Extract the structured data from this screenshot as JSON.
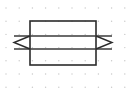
{
  "canvas": {
    "width": 128,
    "height": 88,
    "background_color": "#ffffff",
    "title": "Dimension arrow through rectangle on dot grid"
  },
  "grid": {
    "name": "dot-grid",
    "dot_color": "#c9c9c9",
    "dot_radius": 0.7,
    "origin_x": 6,
    "origin_y": 8,
    "spacing_x": 13.2,
    "spacing_y": 13.2,
    "columns": 10,
    "rows": 7
  },
  "shapes": {
    "rectangle": {
      "name": "outer-rectangle",
      "x": 30,
      "y": 21,
      "width": 66,
      "height": 44,
      "stroke_color": "#2b2b2b",
      "stroke_width": 1.6,
      "fill": "none"
    },
    "band": {
      "name": "horizontal-band",
      "top_line_y": 36,
      "bottom_line_y": 49,
      "left_x": 14,
      "right_x": 112,
      "stroke_color": "#3a3a3a",
      "stroke_width": 1.5
    },
    "left_arrow_head": {
      "name": "left-arrowhead",
      "tip_x": 14,
      "tip_y": 42.5,
      "base_x": 30,
      "top_y": 36,
      "bottom_y": 49,
      "stroke_color": "#2b2b2b"
    },
    "right_arrow_head": {
      "name": "right-arrowhead",
      "tip_x": 112,
      "tip_y": 42.5,
      "base_x": 96,
      "top_y": 36,
      "bottom_y": 49,
      "stroke_color": "#2b2b2b"
    }
  },
  "chart_data": {
    "type": "diagram",
    "elements": [
      {
        "kind": "rectangle",
        "x": 30,
        "y": 21,
        "width": 66,
        "height": 44
      },
      {
        "kind": "line",
        "x1": 14,
        "y1": 36,
        "x2": 112,
        "y2": 36
      },
      {
        "kind": "line",
        "x1": 14,
        "y1": 49,
        "x2": 112,
        "y2": 49
      },
      {
        "kind": "polyline",
        "points": "30,36 14,42.5 30,49"
      },
      {
        "kind": "polyline",
        "points": "96,36 112,42.5 96,49"
      }
    ],
    "labels": [],
    "legend": []
  }
}
